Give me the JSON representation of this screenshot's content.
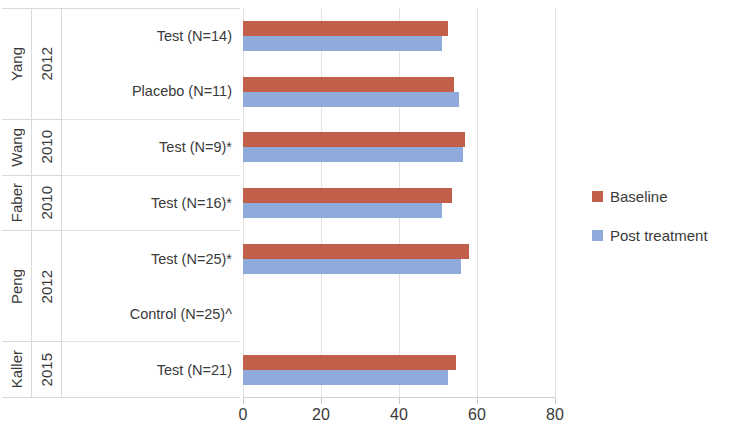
{
  "chart_data": {
    "type": "bar",
    "orientation": "horizontal",
    "title": "",
    "xlabel": "",
    "ylabel": "",
    "xlim": [
      0,
      80
    ],
    "xticks": [
      0,
      20,
      40,
      60,
      80
    ],
    "xticklabels": [
      "0",
      "20",
      "40",
      "60",
      "80"
    ],
    "grid": true,
    "legend_position": "right",
    "categories": [
      "Test (N=14)",
      "Placebo (N=11)",
      "Test (N=9)*",
      "Test (N=16)*",
      "Test (N=25)*",
      "Control (N=25)^",
      "Test (N=21)"
    ],
    "series": [
      {
        "name": "Baseline",
        "color": "#c0604a",
        "values": [
          52.5,
          54.0,
          57.0,
          53.5,
          58.0,
          null,
          54.5
        ]
      },
      {
        "name": "Post treatment",
        "color": "#8fabdc",
        "values": [
          51.0,
          55.5,
          56.5,
          51.0,
          56.0,
          null,
          52.5
        ]
      }
    ]
  },
  "axis": {
    "study_groups": [
      {
        "study": "Yang",
        "year": "2012",
        "rows": 2
      },
      {
        "study": "Wang",
        "year": "2010",
        "rows": 1
      },
      {
        "study": "Faber",
        "year": "2010",
        "rows": 1
      },
      {
        "study": "Peng",
        "year": "2012",
        "rows": 2
      },
      {
        "study": "Kaller",
        "year": "2015",
        "rows": 1
      }
    ],
    "group_labels": [
      "Test (N=14)",
      "Placebo (N=11)",
      "Test (N=9)*",
      "Test (N=16)*",
      "Test (N=25)*",
      "Control (N=25)^",
      "Test (N=21)"
    ]
  },
  "legend": {
    "items": [
      {
        "label": "Baseline",
        "color": "#c0604a"
      },
      {
        "label": "Post treatment",
        "color": "#8fabdc"
      }
    ]
  }
}
